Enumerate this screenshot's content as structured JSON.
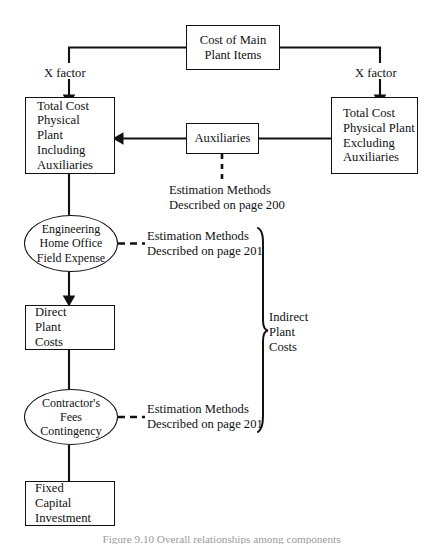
{
  "figure": {
    "caption": "Figure 9.10  Overall relationships among components",
    "type": "flowchart"
  },
  "nodes": {
    "cost_main": {
      "shape": "box",
      "lines": [
        "Cost of Main",
        "Plant Items"
      ]
    },
    "total_incl": {
      "shape": "box",
      "lines": [
        "Total Cost",
        "Physical",
        "Plant",
        "Including",
        "Auxiliaries"
      ]
    },
    "total_excl": {
      "shape": "box",
      "lines": [
        "Total Cost",
        "Physical Plant",
        "Excluding",
        "Auxiliaries"
      ]
    },
    "auxiliaries": {
      "shape": "box",
      "lines": [
        "Auxiliaries"
      ]
    },
    "engineering": {
      "shape": "ellipse",
      "lines": [
        "Engineering",
        "Home Office",
        "Field Expense"
      ]
    },
    "direct_plant": {
      "shape": "box",
      "lines": [
        "Direct",
        "Plant",
        "Costs"
      ]
    },
    "contractor": {
      "shape": "ellipse",
      "lines": [
        "Contractor's",
        "Fees",
        "Contingency"
      ]
    },
    "fixed_capital": {
      "shape": "box",
      "lines": [
        "Fixed",
        "Capital",
        "Investment"
      ]
    }
  },
  "labels": {
    "x_factor_left": "X factor",
    "x_factor_right": "X factor",
    "indirect_plant_costs": [
      "Indirect",
      "Plant",
      "Costs"
    ]
  },
  "annotations": {
    "aux_methods": [
      "Estimation Methods",
      "Described on page 200"
    ],
    "eng_methods": [
      "Estimation Methods",
      "Described on page 201"
    ],
    "contractor_methods": [
      "Estimation Methods",
      "Described on page 201"
    ]
  },
  "colors": {
    "ink": "#111111",
    "background": "#ffffff",
    "caption": "#9a9a9a"
  }
}
